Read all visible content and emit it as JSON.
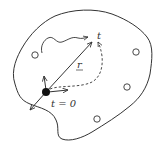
{
  "diagram": {
    "type": "random-walk-in-bounded-domain",
    "labels": {
      "end_time": "t",
      "displacement": "r",
      "start_time": "t = 0"
    },
    "colors": {
      "stroke": "#333333",
      "background": "#ffffff",
      "particle": "#111111"
    },
    "traps": [
      {
        "cx": 35,
        "cy": 55
      },
      {
        "cx": 136,
        "cy": 52
      },
      {
        "cx": 127,
        "cy": 87
      },
      {
        "cx": 97,
        "cy": 119
      }
    ],
    "particle": {
      "cx": 46,
      "cy": 92,
      "r": 4
    }
  }
}
